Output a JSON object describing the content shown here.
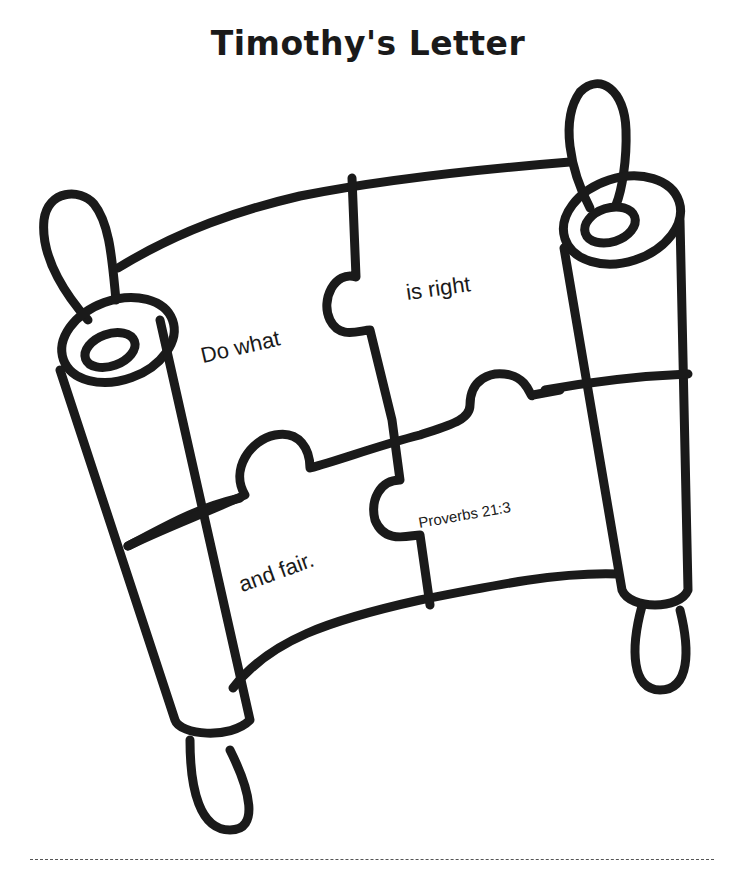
{
  "page": {
    "title": "Timothy's Letter"
  },
  "puzzle": {
    "pieces": [
      {
        "text": "Do what"
      },
      {
        "text": "is right"
      },
      {
        "text": "and fair."
      },
      {
        "text": "Proverbs 21:3"
      }
    ]
  },
  "colors": {
    "ink": "#1a1a1a",
    "background": "#ffffff"
  }
}
